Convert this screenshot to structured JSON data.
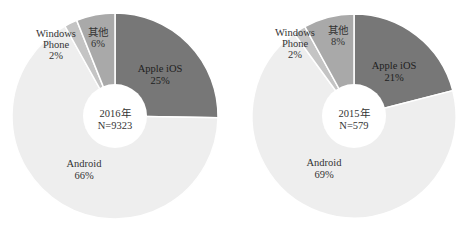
{
  "chart_data": [
    {
      "type": "pie",
      "variant": "donut",
      "title": "2016年",
      "center_label": [
        "2016年",
        "N=9323"
      ],
      "sample_size": 9323,
      "categories": [
        "Apple iOS",
        "Android",
        "Windows Phone",
        "其他"
      ],
      "values": [
        25,
        66,
        2,
        6
      ],
      "value_labels": [
        "25%",
        "66%",
        "2%",
        "6%"
      ],
      "colors": [
        "#777777",
        "#eeeeee",
        "#c4c4c4",
        "#a9a9a9"
      ],
      "start_angle_deg": 0,
      "direction": "clockwise",
      "legend": "none (inline labels)"
    },
    {
      "type": "pie",
      "variant": "donut",
      "title": "2015年",
      "center_label": [
        "2015年",
        "N=579"
      ],
      "sample_size": 579,
      "categories": [
        "Apple iOS",
        "Android",
        "Windows Phone",
        "其他"
      ],
      "values": [
        21,
        69,
        2,
        8
      ],
      "value_labels": [
        "21%",
        "69%",
        "2%",
        "8%"
      ],
      "colors": [
        "#777777",
        "#eeeeee",
        "#c4c4c4",
        "#a9a9a9"
      ],
      "start_angle_deg": 0,
      "direction": "clockwise",
      "legend": "none (inline labels)"
    }
  ],
  "charts": [
    {
      "center_line1": "2016年",
      "center_line2": "N=9323",
      "labels": {
        "ios_name": "Apple iOS",
        "ios_pct": "25%",
        "android_name": "Android",
        "android_pct": "66%",
        "wp_name1": "Windows",
        "wp_name2": "Phone",
        "wp_pct": "2%",
        "other_name": "其他",
        "other_pct": "6%"
      }
    },
    {
      "center_line1": "2015年",
      "center_line2": "N=579",
      "labels": {
        "ios_name": "Apple iOS",
        "ios_pct": "21%",
        "android_name": "Android",
        "android_pct": "69%",
        "wp_name1": "Windows",
        "wp_name2": "Phone",
        "wp_pct": "2%",
        "other_name": "其他",
        "other_pct": "8%"
      }
    }
  ]
}
